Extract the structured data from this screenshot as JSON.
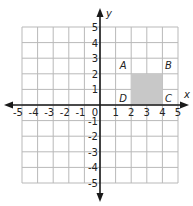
{
  "diagram": {
    "type": "coordinate-plane",
    "axes": {
      "x_label": "x",
      "y_label": "y",
      "min": -5,
      "max": 5
    },
    "x_ticks": [
      "-5",
      "-4",
      "-3",
      "-2",
      "-1",
      "0",
      "1",
      "2",
      "3",
      "4",
      "5"
    ],
    "y_ticks": [
      "5",
      "4",
      "3",
      "2",
      "1",
      "-1",
      "-2",
      "-3",
      "-4",
      "-5"
    ],
    "shaded_region": {
      "x_from": 2,
      "x_to": 4,
      "y_from": 0,
      "y_to": 2,
      "color": "#c8c8c8"
    },
    "points": [
      {
        "name": "A",
        "x": 2,
        "y": 2
      },
      {
        "name": "B",
        "x": 4,
        "y": 2
      },
      {
        "name": "C",
        "x": 4,
        "y": 0
      },
      {
        "name": "D",
        "x": 2,
        "y": 0
      }
    ],
    "colors": {
      "grid": "#b9b9b9",
      "axis": "#1a1a1a"
    }
  }
}
